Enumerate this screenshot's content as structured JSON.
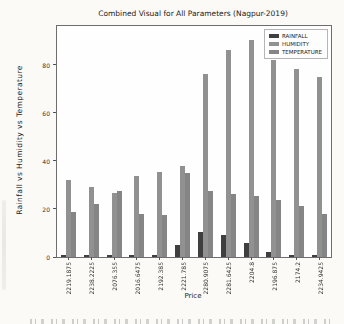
{
  "figure": {
    "title": "Combined Visual for All Parameters (Nagpur-2019)",
    "xlabel": "Price",
    "ylabel": "Rainfall vs Humidity vs Temperature"
  },
  "colors": {
    "rainfall": "#3f3f3f",
    "humidity": "#919191",
    "temperature": "#858585",
    "spine": "#6e6e6e",
    "plot_background": "#fefefe"
  },
  "chart_data": {
    "type": "bar",
    "title": "Combined Visual for All Parameters (Nagpur-2019)",
    "xlabel": "Price",
    "ylabel": "Rainfall vs Humidity vs Temperature",
    "categories": [
      "2219.1875",
      "2238.2225",
      "2076.355",
      "2016.6475",
      "2192.385",
      "2221.785",
      "2280.9075",
      "2281.6425",
      "2204.8",
      "2196.875",
      "2174.2",
      "2234.9425"
    ],
    "series": [
      {
        "name": "RAINFALL",
        "color": "#3f3f3f",
        "values": [
          1,
          1,
          1,
          0.8,
          0.8,
          5,
          10.5,
          9,
          6,
          2,
          0.8,
          0.8
        ]
      },
      {
        "name": "HUMIDITY",
        "color": "#919191",
        "values": [
          32,
          29,
          26.5,
          33.5,
          35.5,
          38,
          76,
          86,
          90,
          82,
          78,
          75
        ]
      },
      {
        "name": "TEMPERATURE",
        "color": "#858585",
        "values": [
          18.5,
          22,
          27.5,
          18,
          17.5,
          35,
          27.5,
          26,
          25.5,
          23.5,
          21,
          18
        ]
      }
    ],
    "ylim": [
      0,
      96
    ],
    "yticks": [
      0,
      20,
      40,
      60,
      80
    ],
    "grid": false,
    "legend_position": "upper right"
  }
}
